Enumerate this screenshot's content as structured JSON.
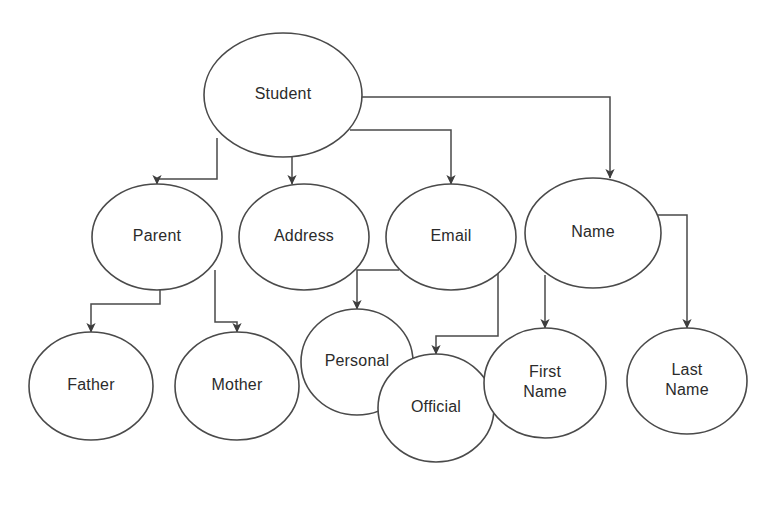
{
  "diagram": {
    "type": "node-link-tree",
    "style": {
      "background": "#ffffff",
      "node_fill": "#ffffff",
      "node_stroke": "#4a4a4a",
      "edge_stroke": "#4a4a4a",
      "label_color": "#2b2b2b"
    },
    "nodes": [
      {
        "id": "student",
        "label": "Student",
        "lines": [
          "Student"
        ],
        "cx": 283,
        "cy": 95,
        "rx": 79,
        "ry": 62
      },
      {
        "id": "parent",
        "label": "Parent",
        "lines": [
          "Parent"
        ],
        "cx": 157,
        "cy": 237,
        "rx": 65,
        "ry": 53
      },
      {
        "id": "address",
        "label": "Address",
        "lines": [
          "Address"
        ],
        "cx": 304,
        "cy": 237,
        "rx": 65,
        "ry": 53
      },
      {
        "id": "email",
        "label": "Email",
        "lines": [
          "Email"
        ],
        "cx": 451,
        "cy": 237,
        "rx": 65,
        "ry": 53
      },
      {
        "id": "name",
        "label": "Name",
        "lines": [
          "Name"
        ],
        "cx": 593,
        "cy": 233,
        "rx": 68,
        "ry": 55
      },
      {
        "id": "father",
        "label": "Father",
        "lines": [
          "Father"
        ],
        "cx": 91,
        "cy": 386,
        "rx": 62,
        "ry": 54
      },
      {
        "id": "mother",
        "label": "Mother",
        "lines": [
          "Mother"
        ],
        "cx": 237,
        "cy": 386,
        "rx": 62,
        "ry": 54
      },
      {
        "id": "personal",
        "label": "Personal",
        "lines": [
          "Personal"
        ],
        "cx": 357,
        "cy": 362,
        "rx": 56,
        "ry": 53
      },
      {
        "id": "official",
        "label": "Official",
        "lines": [
          "Official"
        ],
        "cx": 436,
        "cy": 408,
        "rx": 58,
        "ry": 54
      },
      {
        "id": "firstname",
        "label": "First Name",
        "lines": [
          "First",
          "Name"
        ],
        "cx": 545,
        "cy": 383,
        "rx": 61,
        "ry": 55
      },
      {
        "id": "lastname",
        "label": "Last Name",
        "lines": [
          "Last",
          "Name"
        ],
        "cx": 687,
        "cy": 381,
        "rx": 60,
        "ry": 53
      }
    ],
    "edges": [
      {
        "id": "student-parent",
        "from": "student",
        "to": "parent",
        "path": "M 217 138 L 217 179 L 157 179 L 157 184"
      },
      {
        "id": "student-address",
        "from": "student",
        "to": "address",
        "path": "M 292 157 L 292 184"
      },
      {
        "id": "student-email",
        "from": "student",
        "to": "email",
        "path": "M 350 130 L 451 130 L 451 184"
      },
      {
        "id": "student-name",
        "from": "student",
        "to": "name",
        "path": "M 358 97 L 610 97 L 610 178"
      },
      {
        "id": "parent-father",
        "from": "parent",
        "to": "father",
        "path": "M 160 277 L 160 304 L 91 304 L 91 332"
      },
      {
        "id": "parent-mother",
        "from": "parent",
        "to": "mother",
        "path": "M 215 270 L 215 322 L 237 322 L 237 332"
      },
      {
        "id": "email-personal",
        "from": "email",
        "to": "personal",
        "path": "M 399 270 L 357 270 L 357 309"
      },
      {
        "id": "email-official",
        "from": "email",
        "to": "official",
        "path": "M 498 268 L 498 336 L 436 336 L 436 354"
      },
      {
        "id": "name-firstname",
        "from": "name",
        "to": "firstname",
        "path": "M 545 275 L 545 328"
      },
      {
        "id": "name-lastname",
        "from": "name",
        "to": "lastname",
        "path": "M 656 215 L 687 215 L 687 328"
      }
    ]
  }
}
